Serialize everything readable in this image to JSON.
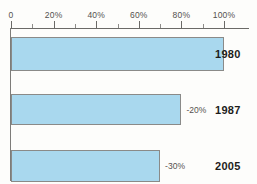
{
  "chart_data": {
    "type": "bar",
    "orientation": "horizontal",
    "title": "",
    "subtitle": "",
    "xlabel": "",
    "ylabel": "",
    "xlim": [
      0,
      100
    ],
    "grid": false,
    "legend": null,
    "categories": [
      "1980",
      "1987",
      "2005"
    ],
    "values": [
      100,
      80,
      70
    ],
    "axis": {
      "major_ticks": [
        0,
        20,
        40,
        60,
        80,
        100
      ],
      "minor_ticks": [
        10,
        30,
        50,
        70,
        90
      ],
      "tick_labels": [
        "0",
        "20%",
        "40%",
        "60%",
        "80%",
        "100%"
      ]
    },
    "bars": [
      {
        "category": "1980",
        "value": 100,
        "data_label": ""
      },
      {
        "category": "1987",
        "value": 80,
        "data_label": "-20%"
      },
      {
        "category": "2005",
        "value": 70,
        "data_label": "-30%"
      }
    ],
    "colors": {
      "bar_fill": "#a9d8ee",
      "bar_border": "#8a8a88",
      "axis": "#6b6a67",
      "tick_label": "#54524f",
      "data_label": "#55534f",
      "category_label": "#1d1d1b",
      "background": "#fdfdfb"
    }
  }
}
